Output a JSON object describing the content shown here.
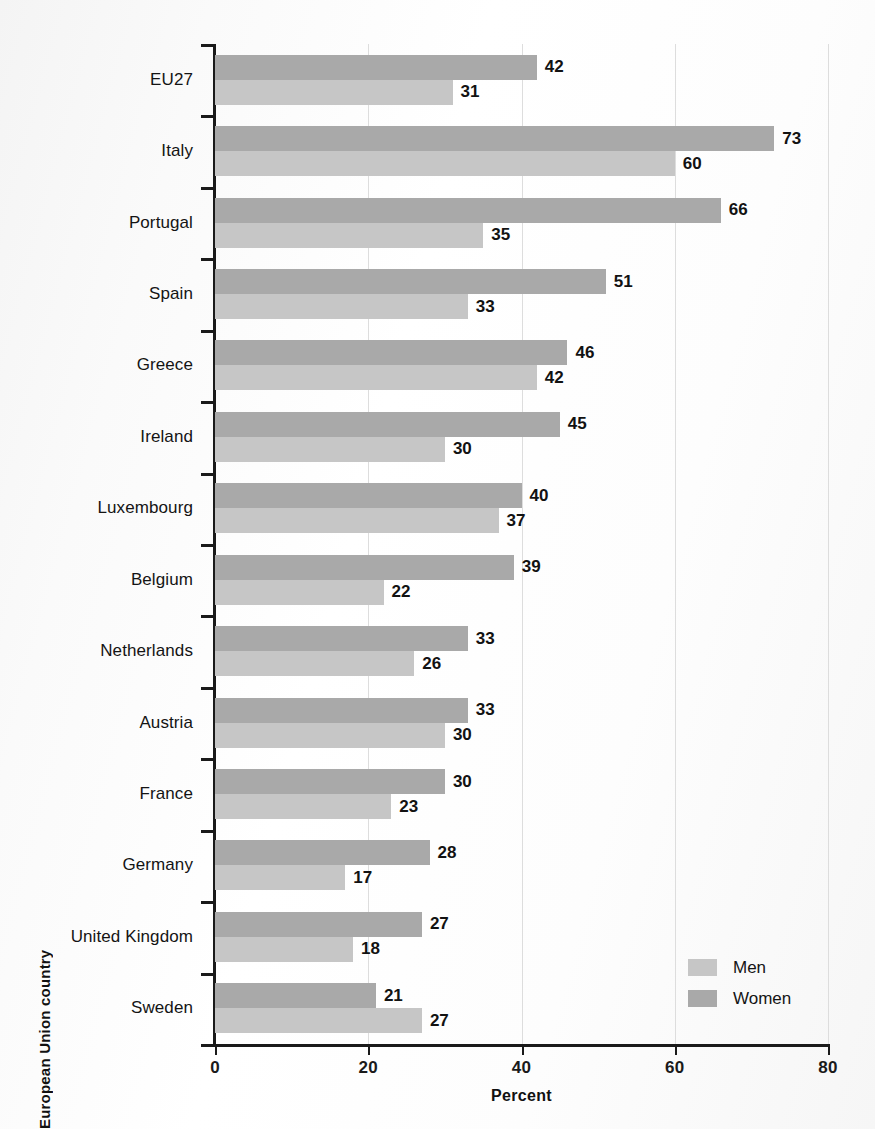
{
  "chart_data": {
    "type": "bar",
    "orientation": "horizontal",
    "title": "",
    "xlabel": "Percent",
    "ylabel": "European Union country",
    "xlim": [
      0,
      80
    ],
    "xticks": [
      0,
      20,
      40,
      60,
      80
    ],
    "grid": "vertical",
    "legend_position": "bottom-right",
    "categories": [
      "EU27",
      "Italy",
      "Portugal",
      "Spain",
      "Greece",
      "Ireland",
      "Luxembourg",
      "Belgium",
      "Netherlands",
      "Austria",
      "France",
      "Germany",
      "United Kingdom",
      "Sweden"
    ],
    "series": [
      {
        "name": "Women",
        "color": "#a9a9a9",
        "values": [
          42,
          73,
          66,
          51,
          46,
          45,
          40,
          39,
          33,
          33,
          30,
          28,
          27,
          21
        ]
      },
      {
        "name": "Men",
        "color": "#c6c6c6",
        "values": [
          31,
          60,
          35,
          33,
          42,
          30,
          37,
          22,
          26,
          30,
          23,
          17,
          18,
          27
        ]
      }
    ]
  },
  "legend": {
    "items": [
      {
        "label": "Men",
        "color": "#c6c6c6"
      },
      {
        "label": "Women",
        "color": "#a9a9a9"
      }
    ]
  }
}
